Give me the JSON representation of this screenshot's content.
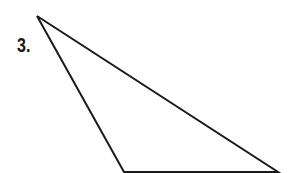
{
  "problem": {
    "number_label": "3.",
    "shape": "triangle",
    "type": "obtuse scalene triangle",
    "vertices": [
      [
        37,
        16
      ],
      [
        124,
        172
      ],
      [
        278,
        172
      ]
    ],
    "stroke_color": "#1a1a1a",
    "stroke_width": 2
  }
}
